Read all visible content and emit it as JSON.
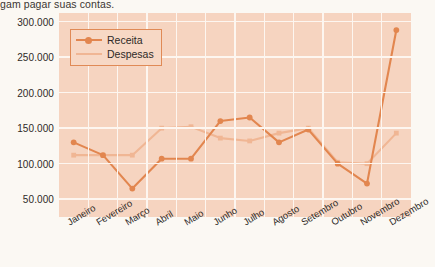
{
  "caption": "gam pagar suas contas.",
  "chart_data": {
    "type": "line",
    "title": "",
    "xlabel": "",
    "ylabel": "",
    "categories": [
      "Janeiro",
      "Fevereiro",
      "Março",
      "Abril",
      "Maio",
      "Junho",
      "Julho",
      "Agosto",
      "Setembro",
      "Outubro",
      "Novembro",
      "Dezembro"
    ],
    "series": [
      {
        "name": "Receita",
        "color": "#e2864f",
        "values": [
          130000,
          112000,
          65000,
          107000,
          107000,
          160000,
          165000,
          130000,
          148000,
          100000,
          72000,
          288000
        ]
      },
      {
        "name": "Despesas",
        "color": "#f0b694",
        "values": [
          112000,
          112000,
          112000,
          150000,
          152000,
          136000,
          132000,
          143000,
          150000,
          102000,
          100000,
          143000
        ]
      }
    ],
    "ylim": [
      25000,
      312000
    ],
    "yticks": [
      50000,
      100000,
      150000,
      200000,
      250000,
      300000
    ],
    "ytick_labels": [
      "50.000",
      "100.000",
      "150.000",
      "200.000",
      "250.000",
      "300.000"
    ],
    "grid": true,
    "legend_position": "top-left",
    "plot_background": "#f6d4c0",
    "gridline_color": "#fdf6f0"
  }
}
